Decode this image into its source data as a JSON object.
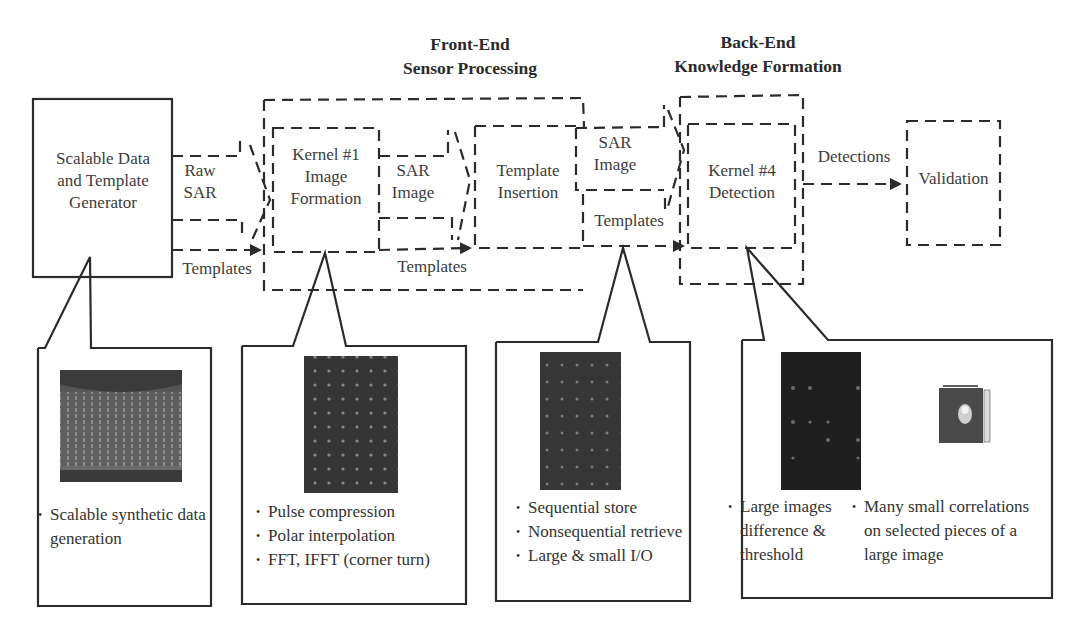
{
  "headers": {
    "front_end": {
      "line1": "Front-End",
      "line2": "Sensor Processing"
    },
    "back_end": {
      "line1": "Back-End",
      "line2": "Knowledge Formation"
    }
  },
  "nodes": {
    "generator": {
      "line1": "Scalable Data",
      "line2": "and Template",
      "line3": "Generator"
    },
    "kernel1": {
      "line1": "Kernel #1",
      "line2": "Image",
      "line3": "Formation"
    },
    "template_insertion": {
      "line1": "Template",
      "line2": "Insertion"
    },
    "kernel4": {
      "line1": "Kernel #4",
      "line2": "Detection"
    },
    "validation": {
      "label": "Validation"
    }
  },
  "edges": {
    "raw_sar": {
      "line1": "Raw",
      "line2": "SAR"
    },
    "templates_1": "Templates",
    "sar_image_1": {
      "line1": "SAR",
      "line2": "Image"
    },
    "templates_2": "Templates",
    "sar_image_2": {
      "line1": "SAR",
      "line2": "Image"
    },
    "templates_3": "Templates",
    "detections": "Detections"
  },
  "callouts": {
    "generator": {
      "bullets": [
        "Scalable synthetic data generation"
      ]
    },
    "kernel1": {
      "bullets": [
        "Pulse compression",
        "Polar interpolation",
        "FFT, IFFT (corner turn)"
      ]
    },
    "storage": {
      "bullets": [
        "Sequential store",
        "Nonsequential retrieve",
        "Large & small I/O"
      ]
    },
    "kernel4": {
      "left_bullets": [
        "Large images difference & threshold"
      ],
      "right_bullets": [
        "Many small correlations on selected pieces of a large image"
      ]
    }
  },
  "colors": {
    "line": "#2b2b2b",
    "text": "#3c3c3c",
    "thumb_dark": "#2e2e2e",
    "thumb_generator": "#6a6a6a"
  }
}
